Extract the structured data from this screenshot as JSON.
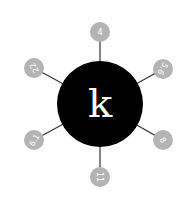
{
  "diagram": {
    "center": {
      "label": "k",
      "fill": "#000000",
      "text_color": "#ffffff"
    },
    "edge_color": "#333333",
    "node_fill": "#b4b4b4",
    "nodes": [
      {
        "label": "4",
        "position": "top"
      },
      {
        "label": "5.6",
        "position": "upper-right"
      },
      {
        "label": "8",
        "position": "lower-right"
      },
      {
        "label": "11",
        "position": "bottom"
      },
      {
        "label": "6.1",
        "position": "lower-left"
      },
      {
        "label": "22",
        "position": "upper-left"
      }
    ]
  }
}
